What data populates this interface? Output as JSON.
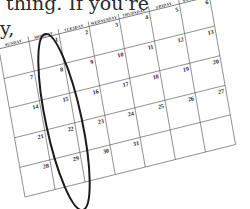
{
  "caption": {
    "line1": "thing. If you're",
    "line2": "y,"
  },
  "calendar": {
    "weekdays": [
      "SUNDAY",
      "MONDAY",
      "TUESDAY",
      "WEDNESDAY",
      "THURSDAY",
      "FRIDAY",
      "SATURDAY"
    ],
    "weeks": [
      [
        "",
        "1",
        "2",
        "3",
        "4",
        "5",
        "6"
      ],
      [
        "7",
        "8",
        "9",
        "10",
        "11",
        "12",
        "13"
      ],
      [
        "14",
        "15",
        "16",
        "17",
        "18",
        "19",
        "20"
      ],
      [
        "21",
        "22",
        "23",
        "24",
        "25",
        "26",
        "27"
      ],
      [
        "28",
        "29",
        "30",
        "31",
        "",
        "",
        ""
      ]
    ],
    "highlighted_column": "MONDAY",
    "ink_color": "#1a1a1a",
    "grid_color": "#555555"
  }
}
